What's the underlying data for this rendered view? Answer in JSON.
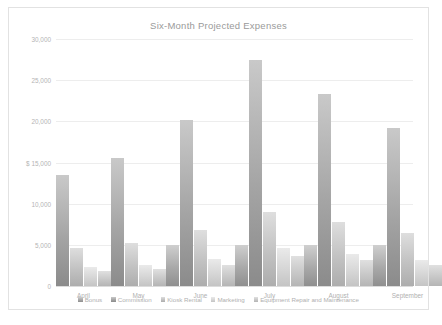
{
  "chart_data": {
    "type": "bar",
    "title": "Six-Month Projected Expenses",
    "xlabel": "",
    "ylabel": "",
    "ylim": [
      0,
      30000
    ],
    "ytick_labels": [
      "30,000",
      "25,000",
      "20,000",
      "$ 15,000",
      "10,000",
      "5,000",
      "0"
    ],
    "ytick_values": [
      30000,
      25000,
      20000,
      15000,
      10000,
      5000,
      0
    ],
    "currency_prefix": "$",
    "grid": true,
    "legend_position": "bottom",
    "categories": [
      "April",
      "May",
      "June",
      "July",
      "August",
      "September"
    ],
    "series": [
      {
        "name": "Bonus",
        "color": "#a9a9a9",
        "values": [
          0,
          0,
          5000,
          5000,
          5000,
          5000
        ]
      },
      {
        "name": "Commission",
        "color": "#a5a5a5",
        "values": [
          13500,
          15500,
          20200,
          27500,
          23300,
          19200
        ]
      },
      {
        "name": "Kiosk Rental",
        "color": "#c2c2c2",
        "values": [
          4600,
          5200,
          6800,
          9000,
          7800,
          6400
        ]
      },
      {
        "name": "Marketing",
        "color": "#d6d6d6",
        "values": [
          2300,
          2500,
          3300,
          4600,
          3900,
          3200
        ]
      },
      {
        "name": "Equipment Repair and Maintenance",
        "color": "#c8c8c8",
        "values": [
          1800,
          2100,
          2600,
          3700,
          3100,
          2600
        ]
      }
    ]
  }
}
